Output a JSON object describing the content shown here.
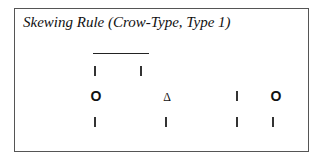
{
  "diagram": {
    "title": "Skewing Rule (Crow-Type, Type 1)",
    "rows": [
      {
        "name": "row-1",
        "items": [
          {
            "kind": "bar",
            "x": 95,
            "y": 66
          },
          {
            "kind": "bar",
            "x": 141,
            "y": 66
          }
        ],
        "overline": {
          "x1": 93,
          "x2": 149,
          "y": 53
        }
      },
      {
        "name": "row-2",
        "items": [
          {
            "kind": "circle",
            "glyph": "O",
            "x": 96,
            "y": 96
          },
          {
            "kind": "triangle",
            "glyph": "Δ",
            "x": 167,
            "y": 97
          },
          {
            "kind": "bar",
            "x": 237,
            "y": 91
          },
          {
            "kind": "circle",
            "glyph": "O",
            "x": 276,
            "y": 96
          }
        ]
      },
      {
        "name": "row-3",
        "items": [
          {
            "kind": "bar",
            "x": 95,
            "y": 117
          },
          {
            "kind": "bar",
            "x": 166,
            "y": 117
          },
          {
            "kind": "bar",
            "x": 237,
            "y": 117
          },
          {
            "kind": "bar",
            "x": 273,
            "y": 117
          }
        ]
      }
    ]
  }
}
